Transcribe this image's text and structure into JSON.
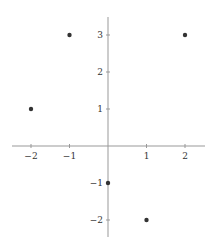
{
  "chart_data": {
    "type": "scatter",
    "title": "",
    "xlabel": "",
    "ylabel": "",
    "xlim": [
      -2.5,
      2.5
    ],
    "ylim": [
      -2.5,
      3.5
    ],
    "grid": false,
    "legend": null,
    "x_ticks": [
      -2,
      -1,
      1,
      2
    ],
    "x_tick_labels": [
      "−2",
      "−1",
      "1",
      "2"
    ],
    "y_ticks": [
      -2,
      -1,
      1,
      2,
      3
    ],
    "y_tick_labels": [
      "−2",
      "−1",
      "1",
      "2",
      "3"
    ],
    "points": [
      {
        "x": -1,
        "y": 3
      },
      {
        "x": 2,
        "y": 3
      },
      {
        "x": -2,
        "y": 1
      },
      {
        "x": 0,
        "y": -1
      },
      {
        "x": 1,
        "y": -2
      }
    ],
    "colors": {
      "axis": "#999999",
      "point": "#333333",
      "label": "#333333"
    }
  }
}
